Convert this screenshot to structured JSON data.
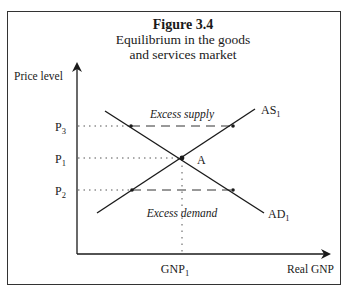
{
  "figure": {
    "number": "Figure 3.4",
    "title_line1": "Equilibrium in the goods",
    "title_line2": "and services market"
  },
  "axes": {
    "y_label": "Price level",
    "x_label": "Real GNP"
  },
  "price_levels": [
    {
      "base": "P",
      "sub": "3"
    },
    {
      "base": "P",
      "sub": "1"
    },
    {
      "base": "P",
      "sub": "2"
    }
  ],
  "quantity_levels": [
    {
      "base": "GNP",
      "sub": "1"
    }
  ],
  "curves": {
    "supply": {
      "base": "AS",
      "sub": "1"
    },
    "demand": {
      "base": "AD",
      "sub": "1"
    }
  },
  "equilibrium_label": "A",
  "regions": {
    "upper": "Excess supply",
    "lower": "Excess demand"
  },
  "colors": {
    "ink": "#1a1a1a",
    "frame": "#333333",
    "background": "#ffffff"
  }
}
